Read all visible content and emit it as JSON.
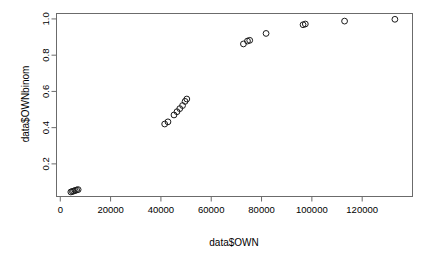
{
  "chart_data": {
    "type": "scatter",
    "title": "",
    "xlabel": "data$OWN",
    "ylabel": "data$OWNbinom",
    "xlim": [
      -1500,
      140000
    ],
    "ylim": [
      0.02,
      1.03
    ],
    "grid": false,
    "legend": null,
    "point_symbol": "open-circle",
    "point_color": "#1a1a1a",
    "xticks": [
      0,
      20000,
      40000,
      60000,
      80000,
      100000,
      120000
    ],
    "xtick_labels": [
      "0",
      "20000",
      "40000",
      "60000",
      "80000",
      "100000",
      "120000"
    ],
    "yticks": [
      0.2,
      0.4,
      0.6,
      0.8,
      1.0
    ],
    "ytick_labels": [
      "0.2",
      "0.4",
      "0.6",
      "0.8",
      "1.0"
    ],
    "points": [
      {
        "x": 4200,
        "y": 0.045
      },
      {
        "x": 4800,
        "y": 0.048
      },
      {
        "x": 5300,
        "y": 0.05
      },
      {
        "x": 5900,
        "y": 0.053
      },
      {
        "x": 6500,
        "y": 0.056
      },
      {
        "x": 7100,
        "y": 0.058
      },
      {
        "x": 41500,
        "y": 0.42
      },
      {
        "x": 42800,
        "y": 0.432
      },
      {
        "x": 45200,
        "y": 0.47
      },
      {
        "x": 46400,
        "y": 0.488
      },
      {
        "x": 47500,
        "y": 0.505
      },
      {
        "x": 48600,
        "y": 0.522
      },
      {
        "x": 49600,
        "y": 0.545
      },
      {
        "x": 50300,
        "y": 0.558
      },
      {
        "x": 72800,
        "y": 0.862
      },
      {
        "x": 74400,
        "y": 0.878
      },
      {
        "x": 75300,
        "y": 0.882
      },
      {
        "x": 81800,
        "y": 0.92
      },
      {
        "x": 96500,
        "y": 0.968
      },
      {
        "x": 97400,
        "y": 0.972
      },
      {
        "x": 113000,
        "y": 0.988
      },
      {
        "x": 133000,
        "y": 0.998
      }
    ]
  }
}
